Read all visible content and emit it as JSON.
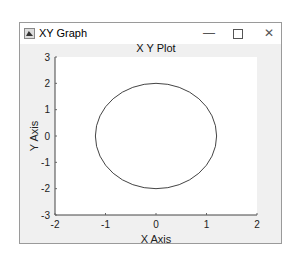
{
  "window": {
    "title": "XY Graph",
    "controls": {
      "minimize": "—",
      "maximize": "",
      "close": "✕"
    },
    "icon": "figure-app-icon"
  },
  "chart_data": {
    "type": "line",
    "title": "X Y Plot",
    "xlabel": "X Axis",
    "ylabel": "Y Axis",
    "xlim": [
      -2,
      2
    ],
    "ylim": [
      -3,
      3
    ],
    "xticks": [
      -2,
      -1,
      0,
      1,
      2
    ],
    "yticks": [
      -3,
      -2,
      -1,
      0,
      1,
      2,
      3
    ],
    "grid": false,
    "legend": null,
    "series": [
      {
        "name": "ellipse",
        "shape": "ellipse",
        "center": [
          0,
          0
        ],
        "rx": 1.2,
        "ry": 2.0,
        "color": "#444444"
      }
    ]
  },
  "colors": {
    "plot_background": "#ffffff",
    "figure_background": "#f0f0f0",
    "axis_color": "#444444",
    "line_color": "#444444"
  }
}
